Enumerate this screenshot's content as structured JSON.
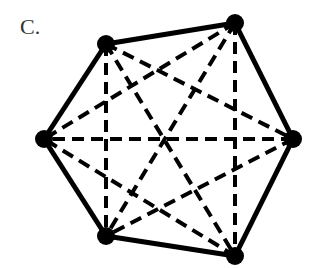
{
  "label": "C.",
  "graph": {
    "vertices": [
      {
        "id": "A",
        "x": 106,
        "y": 44
      },
      {
        "id": "B",
        "x": 235,
        "y": 23
      },
      {
        "id": "C",
        "x": 293,
        "y": 139
      },
      {
        "id": "D",
        "x": 235,
        "y": 256
      },
      {
        "id": "E",
        "x": 106,
        "y": 236
      },
      {
        "id": "F",
        "x": 44,
        "y": 139
      }
    ],
    "solid_edges": [
      [
        "A",
        "B"
      ],
      [
        "B",
        "C"
      ],
      [
        "C",
        "D"
      ],
      [
        "D",
        "E"
      ],
      [
        "E",
        "F"
      ],
      [
        "F",
        "A"
      ]
    ],
    "dashed_edges": [
      [
        "A",
        "C"
      ],
      [
        "A",
        "D"
      ],
      [
        "A",
        "E"
      ],
      [
        "B",
        "D"
      ],
      [
        "B",
        "E"
      ],
      [
        "B",
        "F"
      ],
      [
        "C",
        "E"
      ],
      [
        "C",
        "F"
      ],
      [
        "D",
        "F"
      ]
    ],
    "color": "#000000"
  }
}
